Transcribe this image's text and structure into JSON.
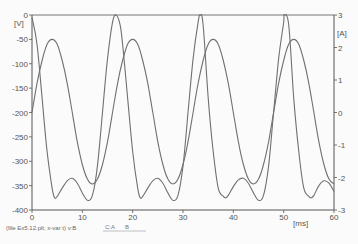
{
  "chart_data": {
    "type": "line",
    "title": "",
    "xlabel": "[ms]",
    "ylabel_left": "[V]",
    "ylabel_right": "[A]",
    "xlim": [
      0,
      60
    ],
    "ylim_left": [
      -400,
      0
    ],
    "ylim_right": [
      -3,
      3
    ],
    "x_ticks": [
      0,
      10,
      20,
      30,
      40,
      50,
      60
    ],
    "y_ticks_left": [
      0,
      -50,
      -100,
      -150,
      -200,
      -250,
      -300,
      -350,
      -400
    ],
    "y_ticks_right": [
      3,
      2,
      1,
      0,
      -1,
      -2,
      -3
    ],
    "grid": false,
    "series": [
      {
        "name": "B",
        "axis": "left",
        "unit": "V",
        "description": "Voltage waveform, period ~16.7 ms, peaks at 0 V, double-dip trough ~-375/-380 V with local max ~-335 V",
        "x": [
          0,
          1,
          2,
          3,
          4,
          4.5,
          5,
          6,
          7,
          8,
          9,
          10,
          11,
          12,
          13,
          14,
          15,
          16,
          16.7,
          17.5,
          18,
          19,
          20,
          21,
          21.5,
          22,
          23,
          24,
          25,
          26,
          27,
          28,
          29,
          30,
          31,
          32,
          33,
          33.4,
          34,
          35,
          36,
          37,
          38,
          38.5,
          39,
          40,
          41,
          42,
          43,
          44,
          45,
          46,
          47,
          48,
          49,
          50,
          50.1,
          51,
          52,
          53,
          54,
          55,
          55.5,
          56,
          57,
          58,
          59,
          60
        ],
        "values": [
          -5,
          -60,
          -170,
          -280,
          -355,
          -375,
          -372,
          -355,
          -340,
          -335,
          -345,
          -365,
          -380,
          -370,
          -310,
          -200,
          -90,
          -15,
          0,
          -20,
          -60,
          -170,
          -280,
          -355,
          -375,
          -372,
          -355,
          -340,
          -335,
          -345,
          -365,
          -380,
          -370,
          -310,
          -200,
          -90,
          -15,
          0,
          -20,
          -170,
          -280,
          -355,
          -372,
          -375,
          -370,
          -352,
          -338,
          -335,
          -345,
          -365,
          -380,
          -370,
          -310,
          -200,
          -90,
          -15,
          0,
          -20,
          -170,
          -280,
          -355,
          -372,
          -375,
          -370,
          -350,
          -340,
          -345,
          -362
        ]
      },
      {
        "name": "A",
        "axis": "right",
        "unit": "A",
        "description": "Current waveform, sinusoidal, period ~16.7 ms, amplitude ~2.2 A",
        "x": [
          0,
          1,
          2,
          3,
          4,
          5,
          6,
          7,
          8,
          9,
          10,
          11,
          12,
          13,
          14,
          15,
          16,
          17,
          18,
          19,
          20,
          21,
          22,
          23,
          24,
          25,
          26,
          27,
          28,
          29,
          30,
          31,
          32,
          33,
          34,
          35,
          36,
          37,
          38,
          39,
          40,
          41,
          42,
          43,
          44,
          45,
          46,
          47,
          48,
          49,
          50,
          51,
          52,
          53,
          54,
          55,
          56,
          57,
          58,
          59,
          60
        ],
        "values": [
          0.0,
          0.9,
          1.6,
          2.1,
          2.25,
          2.1,
          1.6,
          0.9,
          0.0,
          -0.9,
          -1.6,
          -2.05,
          -2.2,
          -2.05,
          -1.6,
          -0.9,
          0.0,
          0.9,
          1.6,
          2.1,
          2.25,
          2.1,
          1.6,
          0.9,
          0.0,
          -0.9,
          -1.6,
          -2.05,
          -2.2,
          -2.05,
          -1.6,
          -0.9,
          0.0,
          0.9,
          1.6,
          2.1,
          2.25,
          2.1,
          1.6,
          0.9,
          0.0,
          -0.9,
          -1.6,
          -2.05,
          -2.2,
          -2.05,
          -1.6,
          -0.9,
          0.0,
          0.9,
          1.6,
          2.1,
          2.25,
          2.1,
          1.6,
          0.9,
          0.0,
          -0.9,
          -1.6,
          -2.05,
          -2.2
        ]
      }
    ],
    "legend": [
      "C:A",
      "B"
    ],
    "legend_position": "bottom"
  },
  "labels": {
    "left_unit": "[V]",
    "right_unit": "[A]",
    "x_unit": "[ms]",
    "footer": "(file Ex5.12.plt; x-var t)  v:B",
    "legend_a": "C:A",
    "legend_b": "B"
  },
  "colors": {
    "axis": "#555555",
    "curve": "#707070",
    "background": "#fbfbfb"
  }
}
